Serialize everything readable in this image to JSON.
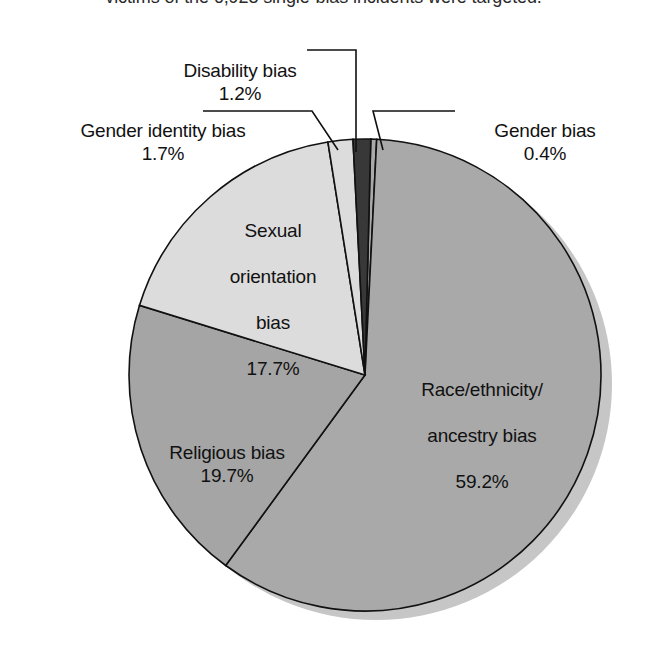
{
  "caption": {
    "text": "victims of the 6,928 single-bias incidents were targeted."
  },
  "chart_data": {
    "type": "pie",
    "title": "",
    "subtitle": "",
    "xlabel": "",
    "ylabel": "",
    "legend": "none",
    "grid": false,
    "units": "percent",
    "total": 100.0,
    "start_angle_deg": 1.4,
    "direction": "clockwise",
    "categories": [
      "Gender bias",
      "Race/ethnicity/ancestry bias",
      "Religious bias",
      "Sexual orientation bias",
      "Gender identity bias",
      "Disability bias"
    ],
    "values": [
      0.4,
      59.2,
      19.7,
      17.7,
      1.7,
      1.2
    ],
    "slices": [
      {
        "label": "Gender bias",
        "label_line1": "Gender bias",
        "percent_text": "0.4%",
        "value": 0.4,
        "color": "#a9a9a9",
        "label_placement": "outside-right",
        "leader": true
      },
      {
        "label": "Race/ethnicity/ancestry bias",
        "label_line1": "Race/ethnicity/",
        "label_line2": "ancestry bias",
        "percent_text": "59.2%",
        "value": 59.2,
        "color": "#a9a9a9",
        "label_placement": "inside",
        "leader": false
      },
      {
        "label": "Religious bias",
        "label_line1": "Religious bias",
        "percent_text": "19.7%",
        "value": 19.7,
        "color": "#a5a5a5",
        "label_placement": "inside",
        "leader": false
      },
      {
        "label": "Sexual orientation bias",
        "label_line1": "Sexual",
        "label_line2": "orientation",
        "label_line3": "bias",
        "percent_text": "17.7%",
        "value": 17.7,
        "color": "#dcdcdc",
        "label_placement": "inside",
        "leader": false
      },
      {
        "label": "Gender identity bias",
        "label_line1": "Gender identity bias",
        "percent_text": "1.7%",
        "value": 1.7,
        "color": "#dcdcdc",
        "label_placement": "outside-left",
        "leader": true
      },
      {
        "label": "Disability bias",
        "label_line1": "Disability bias",
        "percent_text": "1.2%",
        "value": 1.2,
        "color": "#383838",
        "label_placement": "outside-top",
        "leader": true
      }
    ],
    "colors": {
      "outline": "#111111",
      "shadow": "#c6c6c6",
      "background": "#ffffff",
      "light_gray": "#dcdcdc",
      "mid_gray": "#a9a9a9",
      "dark_gray": "#383838"
    },
    "geometry": {
      "center_x": 365,
      "center_y": 375,
      "radius": 236,
      "shadow_offset_x": 11,
      "shadow_offset_y": 9
    }
  },
  "labels": {
    "disability": {
      "name": "Disability bias",
      "percent": "1.2%"
    },
    "gender_identity": {
      "name": "Gender identity bias",
      "percent": "1.7%"
    },
    "gender": {
      "name": "Gender bias",
      "percent": "0.4%"
    },
    "sexual_orientation": {
      "name_l1": "Sexual",
      "name_l2": "orientation",
      "name_l3": "bias",
      "percent": "17.7%"
    },
    "religious": {
      "name": "Religious bias",
      "percent": "19.7%"
    },
    "race": {
      "name_l1": "Race/ethnicity/",
      "name_l2": "ancestry bias",
      "percent": "59.2%"
    }
  }
}
